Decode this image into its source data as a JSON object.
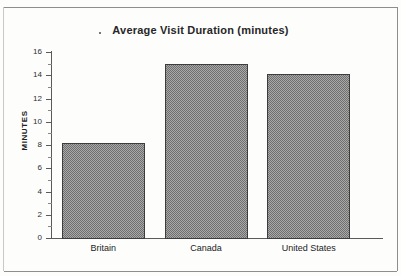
{
  "chart_data": {
    "type": "bar",
    "title": "Average Visit Duration (minutes)",
    "title_bullet": "·",
    "xlabel": "",
    "ylabel": "MINUTES",
    "categories": [
      "Britain",
      "Canada",
      "United States"
    ],
    "values": [
      8.2,
      15.0,
      14.1
    ],
    "ylim": [
      0,
      16
    ],
    "ytick_step": 2,
    "yminor_step": 1,
    "ytick_labels": [
      "0",
      "2",
      "4",
      "6",
      "8",
      "10",
      "12",
      "14",
      "16"
    ],
    "grid": false,
    "legend": null,
    "bar_fill_color": "#8a8a8a",
    "bar_edge_color": "#3d3d3d",
    "axis_color": "#5a5a5a",
    "text_color": "#232323",
    "background_color": "#fdfdfc"
  }
}
